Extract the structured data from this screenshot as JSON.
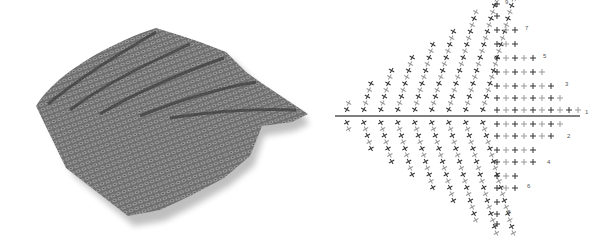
{
  "figure": {
    "photo": {
      "subject": "crocheted leaf sample",
      "color": "#7a7a7a"
    },
    "diagram": {
      "type": "crochet stitch chart",
      "stitch_symbols": [
        "single-crochet-cross",
        "chain-oval",
        "slip-stitch"
      ],
      "row_labels": {
        "upper": [
          "1",
          "3",
          "5",
          "7",
          "9"
        ],
        "lower": [
          "2",
          "4",
          "6",
          "8"
        ]
      },
      "colors": {
        "stitch_dark": "#333333",
        "stitch_light": "#999999"
      }
    }
  }
}
